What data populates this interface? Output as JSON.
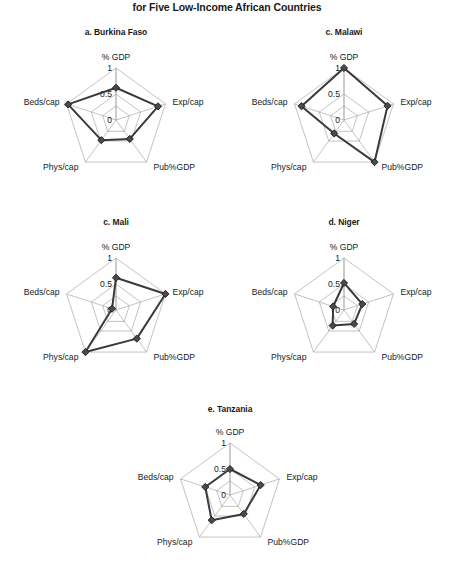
{
  "figure": {
    "title": "for Five Low-Income African Countries",
    "axes": [
      "% GDP",
      "Exp/cap",
      "Pub%GDP",
      "Phys/cap",
      "Beds/cap"
    ],
    "ticks": [
      "1",
      "0.5",
      "0"
    ],
    "tick_values": [
      1,
      0.5,
      0
    ]
  },
  "chart_data": [
    {
      "type": "radar",
      "title": "a. Burkina Faso",
      "categories": [
        "% GDP",
        "Exp/cap",
        "Pub%GDP",
        "Phys/cap",
        "Beds/cap"
      ],
      "values": [
        0.62,
        0.85,
        0.45,
        0.48,
        0.97
      ],
      "rlim": [
        0,
        1
      ],
      "ticks": [
        0,
        0.5,
        1
      ],
      "grid": true,
      "legend": "none"
    },
    {
      "type": "radar",
      "title": "c. Malawi",
      "categories": [
        "% GDP",
        "Exp/cap",
        "Pub%GDP",
        "Phys/cap",
        "Beds/cap"
      ],
      "values": [
        1.0,
        0.88,
        1.0,
        0.32,
        0.86
      ],
      "rlim": [
        0,
        1
      ],
      "ticks": [
        0,
        0.5,
        1
      ],
      "grid": true,
      "legend": "none"
    },
    {
      "type": "radar",
      "title": "c. Mali",
      "categories": [
        "% GDP",
        "Exp/cap",
        "Pub%GDP",
        "Phys/cap",
        "Beds/cap"
      ],
      "values": [
        0.62,
        1.0,
        0.68,
        1.0,
        0.08
      ],
      "rlim": [
        0,
        1
      ],
      "ticks": [
        0,
        0.5,
        1
      ],
      "grid": true,
      "legend": "none"
    },
    {
      "type": "radar",
      "title": "d. Niger",
      "categories": [
        "% GDP",
        "Exp/cap",
        "Pub%GDP",
        "Phys/cap",
        "Beds/cap"
      ],
      "values": [
        0.52,
        0.37,
        0.33,
        0.37,
        0.22
      ],
      "rlim": [
        0,
        1
      ],
      "ticks": [
        0,
        0.5,
        1
      ],
      "grid": true,
      "legend": "none"
    },
    {
      "type": "radar",
      "title": "e. Tanzania",
      "categories": [
        "% GDP",
        "Exp/cap",
        "Pub%GDP",
        "Phys/cap",
        "Beds/cap"
      ],
      "values": [
        0.5,
        0.62,
        0.45,
        0.6,
        0.5
      ],
      "rlim": [
        0,
        1
      ],
      "ticks": [
        0,
        0.5,
        1
      ],
      "grid": true,
      "legend": "none"
    }
  ],
  "colors": {
    "series": "#3a3a3a",
    "marker_fill": "#4a4a4a",
    "marker_stroke": "#1d1d1d",
    "grid": "#9a9a9a",
    "text": "#1a1a1a",
    "background": "#ffffff"
  },
  "panels": [
    {
      "key": 0,
      "left": 16,
      "top": 27,
      "width": 200,
      "height": 172
    },
    {
      "key": 1,
      "left": 244,
      "top": 27,
      "width": 200,
      "height": 172
    },
    {
      "key": 2,
      "left": 16,
      "top": 217,
      "width": 200,
      "height": 172
    },
    {
      "key": 3,
      "left": 244,
      "top": 217,
      "width": 200,
      "height": 172
    },
    {
      "key": 4,
      "left": 130,
      "top": 404,
      "width": 200,
      "height": 168
    }
  ]
}
